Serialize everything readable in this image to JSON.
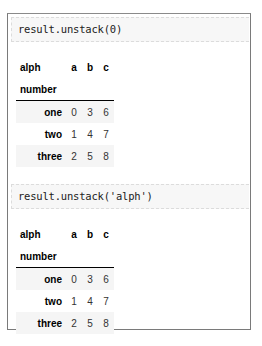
{
  "cells": [
    {
      "code": "result.unstack(0)",
      "output": {
        "columns_name": "alph",
        "index_name": "number",
        "columns": [
          "a",
          "b",
          "c"
        ],
        "rows": [
          {
            "label": "one",
            "values": [
              "0",
              "3",
              "6"
            ]
          },
          {
            "label": "two",
            "values": [
              "1",
              "4",
              "7"
            ]
          },
          {
            "label": "three",
            "values": [
              "2",
              "5",
              "8"
            ]
          }
        ]
      }
    },
    {
      "code": "result.unstack('alph')",
      "output": {
        "columns_name": "alph",
        "index_name": "number",
        "columns": [
          "a",
          "b",
          "c"
        ],
        "rows": [
          {
            "label": "one",
            "values": [
              "0",
              "3",
              "6"
            ]
          },
          {
            "label": "two",
            "values": [
              "1",
              "4",
              "7"
            ]
          },
          {
            "label": "three",
            "values": [
              "2",
              "5",
              "8"
            ]
          }
        ]
      }
    }
  ]
}
